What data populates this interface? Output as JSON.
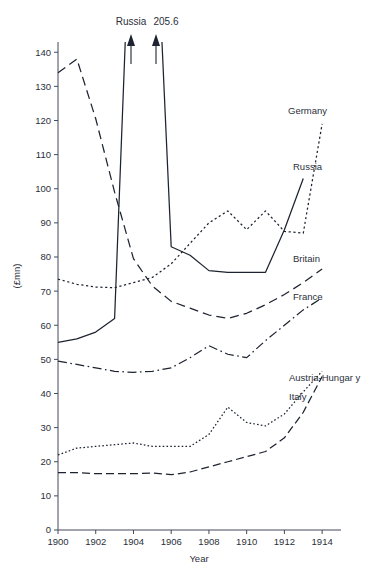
{
  "chart_data": {
    "type": "line",
    "title": "",
    "xlabel": "Year",
    "ylabel": "(£mn)",
    "xlim": [
      1900,
      1915
    ],
    "ylim": [
      0,
      143
    ],
    "xticks": [
      1900,
      1902,
      1904,
      1906,
      1908,
      1910,
      1912,
      1914
    ],
    "yticks": [
      0,
      10,
      20,
      30,
      40,
      50,
      60,
      70,
      80,
      90,
      100,
      110,
      120,
      130,
      140
    ],
    "grid": false,
    "legend_position": "right-inline-labels",
    "x": [
      1900,
      1901,
      1902,
      1903,
      1904,
      1905,
      1906,
      1907,
      1908,
      1909,
      1910,
      1911,
      1912,
      1913,
      1914
    ],
    "series": [
      {
        "name": "Britain",
        "style": "dashed",
        "values": [
          134.0,
          138.0,
          120.5,
          99.0,
          79.5,
          71.5,
          67.0,
          65.0,
          63.0,
          62.0,
          63.5,
          66.0,
          69.0,
          72.5,
          76.5
        ]
      },
      {
        "name": "Germany",
        "style": "dotted",
        "values": [
          73.5,
          72.0,
          71.2,
          71.0,
          72.5,
          74.0,
          78.0,
          84.0,
          90.0,
          93.5,
          88.0,
          93.5,
          87.5,
          87.0,
          119.0
        ]
      },
      {
        "name": "Russia",
        "style": "solid",
        "values": [
          55.0,
          56.0,
          58.0,
          62.0,
          205.6,
          205.6,
          83.0,
          80.5,
          76.0,
          75.5,
          75.5,
          75.5,
          88.0,
          103.0,
          null
        ],
        "note": "1904 and 1905 values exceed the plotted axis; arrows mark the off-scale spike labelled 205.6"
      },
      {
        "name": "France",
        "style": "dash-dot",
        "values": [
          49.5,
          48.5,
          47.5,
          46.5,
          46.2,
          46.5,
          47.5,
          50.5,
          54.0,
          51.5,
          50.5,
          55.5,
          60.0,
          64.5,
          68.0
        ]
      },
      {
        "name": "Austria-Hungary",
        "style": "densely-dotted",
        "values": [
          22.0,
          24.0,
          24.5,
          25.0,
          25.5,
          24.5,
          24.5,
          24.5,
          28.0,
          36.0,
          31.5,
          30.5,
          34.0,
          40.5,
          46.5
        ]
      },
      {
        "name": "Italy",
        "style": "dashed-thick",
        "values": [
          16.8,
          16.8,
          16.5,
          16.5,
          16.5,
          16.7,
          16.2,
          17.0,
          18.5,
          20.0,
          21.5,
          23.0,
          27.0,
          34.5,
          45.0
        ]
      }
    ],
    "annotations": [
      {
        "text": "Russia",
        "at_x": 1904,
        "kind": "off-scale-arrow"
      },
      {
        "text": "205.6",
        "at_x": 1905,
        "kind": "off-scale-arrow"
      }
    ]
  },
  "series_labels": {
    "germany": "Germany",
    "russia": "Russia",
    "britain": "Britain",
    "france": "France",
    "austria_hungary": "Austria-Hungar y",
    "italy": "Italy"
  },
  "annotations": {
    "russia_arrow": "Russia",
    "value_arrow": "205.6"
  },
  "axes": {
    "y_title": "(£mn)",
    "x_title": "Year",
    "y_tick_labels": [
      "0",
      "10",
      "20",
      "30",
      "40",
      "50",
      "60",
      "70",
      "80",
      "90",
      "100",
      "110",
      "120",
      "130",
      "140"
    ],
    "x_tick_labels": [
      "1900",
      "1902",
      "1904",
      "1906",
      "1908",
      "1910",
      "1912",
      "1914"
    ]
  },
  "colors": {
    "ink": "#1d2330",
    "axis": "#44485a",
    "background": "#ffffff"
  }
}
